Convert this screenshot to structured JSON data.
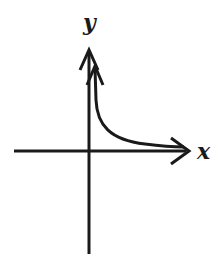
{
  "diagram": {
    "type": "function-graph",
    "axes": {
      "x_label": "x",
      "y_label": "y"
    },
    "colors": {
      "stroke": "#1a1a1a",
      "background": "#ffffff"
    }
  }
}
